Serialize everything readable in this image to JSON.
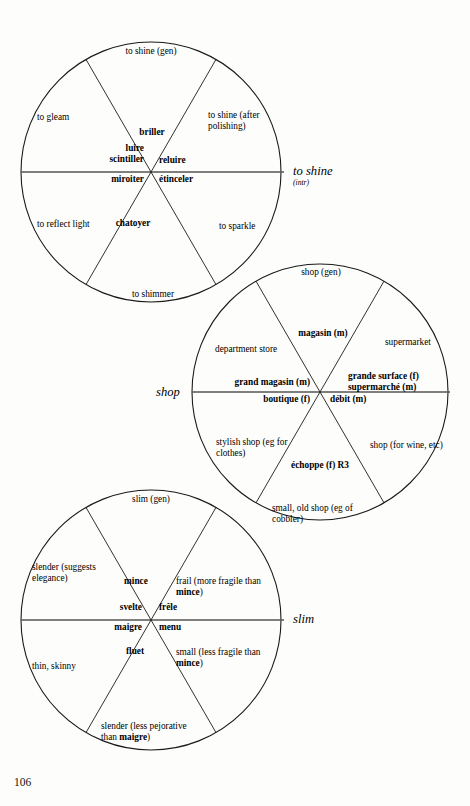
{
  "page": {
    "folio": "106"
  },
  "wheels": [
    {
      "id": "to-shine",
      "headword": "to shine",
      "headword_qualifier": "(intr)",
      "center": [
        151,
        172
      ],
      "radius": 130,
      "sectors": [
        {
          "gloss": "to shine (gen)",
          "term": "briller",
          "gender": ""
        },
        {
          "gloss": "to shine (after\npolishing)",
          "term": "reluire",
          "gender": ""
        },
        {
          "gloss": "to sparkle",
          "term": "étinceler",
          "gender": ""
        },
        {
          "gloss": "to shimmer",
          "term": "chatoyer",
          "gender": ""
        },
        {
          "gloss": "to reflect light",
          "term": "miroiter",
          "gender": ""
        },
        {
          "gloss": "to gleam",
          "term": "luire\nscintiller",
          "gender": ""
        }
      ]
    },
    {
      "id": "shop",
      "headword": "shop",
      "headword_qualifier": "",
      "center": [
        320,
        392
      ],
      "radius": 128,
      "sectors": [
        {
          "gloss": "shop (gen)",
          "term": "magasin",
          "gender": "(m)"
        },
        {
          "gloss": "supermarket",
          "term": "grande surface\nsupermarché",
          "gender": "(f)\n(m)"
        },
        {
          "gloss": "shop (for wine, etc)",
          "term": "débit",
          "gender": "(m)"
        },
        {
          "gloss": "small, old shop (eg of\ncobbler)",
          "term": "échoppe",
          "gender": "(f) R3"
        },
        {
          "gloss": "stylish shop (eg for\nclothes)",
          "term": "boutique",
          "gender": "(f)"
        },
        {
          "gloss": "department store",
          "term": "grand magasin",
          "gender": "(m)"
        }
      ]
    },
    {
      "id": "slim",
      "headword": "slim",
      "headword_qualifier": "",
      "center": [
        151,
        620
      ],
      "radius": 130,
      "sectors": [
        {
          "gloss": "slim (gen)",
          "term": "mince",
          "gender": ""
        },
        {
          "gloss": "frail (more fragile than\nmince)",
          "term": "frêle",
          "gender": ""
        },
        {
          "gloss": "small (less fragile than\nmince)",
          "term": "menu",
          "gender": ""
        },
        {
          "gloss": "slender (less pejorative\nthan maigre)",
          "term": "fluet",
          "gender": ""
        },
        {
          "gloss": "thin, skinny",
          "term": "maigre",
          "gender": ""
        },
        {
          "gloss": "slender (suggests\nelegance)",
          "term": "svelte",
          "gender": ""
        }
      ]
    }
  ],
  "labels": {
    "w1": {
      "top": "to shine (gen)",
      "upper_right": "to shine (after\npolishing)",
      "lower_right": "to sparkle",
      "bottom": "to shimmer",
      "lower_left": "to reflect light",
      "upper_left": "to gleam",
      "t_briller": "briller",
      "t_reluire": "reluire",
      "t_etinceler": "étinceler",
      "t_chatoyer": "chatoyer",
      "t_miroiter": "miroiter",
      "t_luire": "luire\nscintiller",
      "headword": "to shine",
      "qualifier": "(intr)"
    },
    "w2": {
      "top": "shop (gen)",
      "upper_right": "supermarket",
      "lower_right": "shop (for wine, etc)",
      "bottom": "small, old shop (eg of\ncobbler)",
      "lower_left": "stylish shop (eg for\nclothes)",
      "upper_left": "department store",
      "t_magasin": "magasin (m)",
      "t_grande": "grande surface (f)\nsupermarché (m)",
      "t_debit": "débit (m)",
      "t_echoppe": "échoppe (f) R3",
      "t_boutique": "boutique (f)",
      "t_grandmag": "grand magasin (m)",
      "headword": "shop",
      "qualifier": ""
    },
    "w3": {
      "top": "slim (gen)",
      "upper_right": "frail (more fragile than\nmince)",
      "lower_right": "small (less fragile than\nmince)",
      "bottom": "slender (less pejorative\nthan maigre)",
      "lower_left": "thin, skinny",
      "upper_left": "slender (suggests\nelegance)",
      "t_mince": "mince",
      "t_frele": "frêle",
      "t_menu": "menu",
      "t_fluet": "fluet",
      "t_maigre": "maigre",
      "t_svelte": "svelte",
      "headword": "slim",
      "qualifier": ""
    }
  },
  "style": {
    "stroke": "#1a1a1a",
    "ink": "#000000",
    "paper": "#fdfdfb"
  }
}
